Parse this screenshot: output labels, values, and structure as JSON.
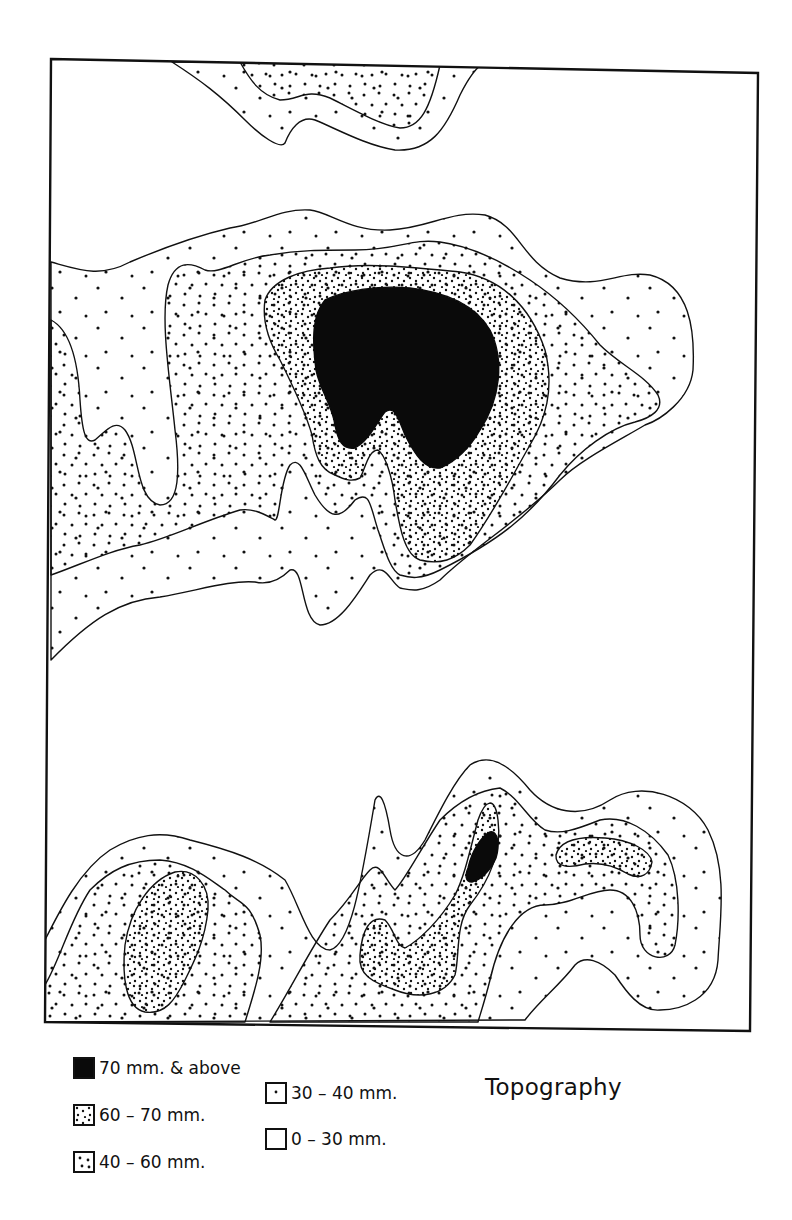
{
  "map": {
    "title": "Topography",
    "frame": {
      "top_left": [
        51,
        59
      ],
      "top_right": [
        758,
        73
      ],
      "bottom_right": [
        750,
        1031
      ],
      "bottom_left": [
        45,
        1022
      ]
    },
    "colors": {
      "line": "#111111",
      "background": "#ffffff",
      "fill_highest": "#0a0a0a"
    }
  },
  "legend": {
    "items": [
      {
        "id": "c70",
        "label": "70 mm. & above",
        "pattern": "solid-black"
      },
      {
        "id": "c60",
        "label": "60 – 70 mm.",
        "pattern": "dense-stipple"
      },
      {
        "id": "c40",
        "label": "40 – 60 mm.",
        "pattern": "medium-stipple"
      },
      {
        "id": "c30",
        "label": "30 – 40 mm.",
        "pattern": "sparse-dot"
      },
      {
        "id": "c0",
        "label": "0 – 30 mm.",
        "pattern": "blank"
      }
    ]
  }
}
